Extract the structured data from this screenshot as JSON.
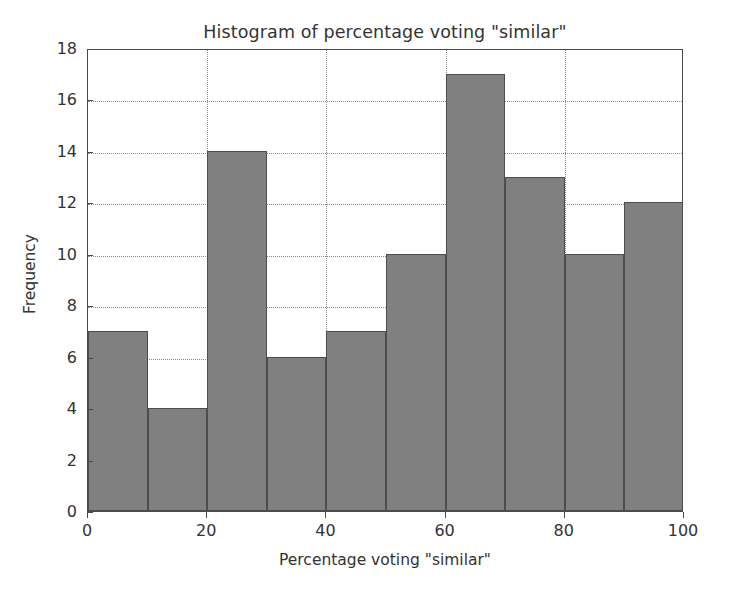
{
  "chart_data": {
    "type": "bar",
    "title": "Histogram of percentage voting \"similar\"",
    "xlabel": "Percentage voting \"similar\"",
    "ylabel": "Frequency",
    "grid": true,
    "legend": null,
    "xlim": [
      0,
      100
    ],
    "ylim": [
      0,
      18
    ],
    "xticks": [
      "0",
      "20",
      "40",
      "60",
      "80",
      "100"
    ],
    "xtick_values": [
      0,
      20,
      40,
      60,
      80,
      100
    ],
    "yticks": [
      "0",
      "2",
      "4",
      "6",
      "8",
      "10",
      "12",
      "14",
      "16",
      "18"
    ],
    "ytick_values": [
      0,
      2,
      4,
      6,
      8,
      10,
      12,
      14,
      16,
      18
    ],
    "bin_width": 10,
    "bin_edges": [
      0,
      10,
      20,
      30,
      40,
      50,
      60,
      70,
      80,
      90,
      100
    ],
    "categories": [
      "0-10",
      "10-20",
      "20-30",
      "30-40",
      "40-50",
      "50-60",
      "60-70",
      "70-80",
      "80-90",
      "90-100"
    ],
    "values": [
      7,
      4,
      14,
      6,
      7,
      10,
      17,
      13,
      10,
      12
    ],
    "bar_color": "#808080",
    "bar_edge_color": "#4d4d4d",
    "axes_color": "#4a4a4a",
    "grid_color": "#8d8d8d",
    "background_color": "#ffffff"
  }
}
